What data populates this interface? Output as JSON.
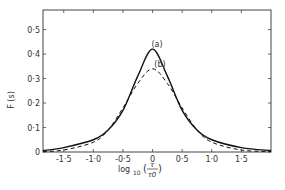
{
  "chart_data": {
    "type": "line",
    "title": "",
    "xlabel": "log10 (τ/τ0)",
    "ylabel": "F (s)",
    "xlim": [
      -1.85,
      2.0
    ],
    "ylim": [
      0,
      0.58
    ],
    "x_ticks": [
      "-1.5",
      "-1.0",
      "-0.5",
      "0",
      "0.5",
      "1.0",
      "1.5"
    ],
    "y_ticks": [
      "0",
      "0.1",
      "0.2",
      "0.3",
      "0.4",
      "0.5"
    ],
    "y_tick_labels": [
      "0",
      "0·1",
      "0·2",
      "0·3",
      "0·4",
      "0·5"
    ],
    "x_tick_labels": [
      "-1·5",
      "-1·0",
      "-0·5",
      "0",
      "0·5",
      "1·0",
      "1·5"
    ],
    "series": [
      {
        "name": "(a)",
        "style": "solid",
        "x": [
          -1.85,
          -1.5,
          -1.0,
          -0.75,
          -0.5,
          -0.25,
          0,
          0.25,
          0.5,
          0.75,
          1.0,
          1.5,
          2.0
        ],
        "y": [
          0.006,
          0.018,
          0.05,
          0.09,
          0.17,
          0.31,
          0.42,
          0.31,
          0.17,
          0.09,
          0.05,
          0.018,
          0.006
        ]
      },
      {
        "name": "(b)",
        "style": "dashed",
        "x": [
          -1.85,
          -1.5,
          -1.0,
          -0.75,
          -0.5,
          -0.25,
          0,
          0.25,
          0.5,
          0.75,
          1.0,
          1.5,
          2.0
        ],
        "y": [
          0.002,
          0.008,
          0.04,
          0.09,
          0.18,
          0.28,
          0.34,
          0.28,
          0.18,
          0.09,
          0.04,
          0.008,
          0.002
        ]
      }
    ],
    "annotations": [
      {
        "text": "(a)",
        "x": 0,
        "y": 0.45
      },
      {
        "text": "(b)",
        "x": 0.05,
        "y": 0.37
      }
    ],
    "grid": false,
    "legend": "none"
  },
  "labels": {
    "ylabel": "F (s)",
    "xlabel_prefix": "log",
    "xlabel_sub": "10",
    "xlabel_num": "τ",
    "xlabel_den": "τ0",
    "annot_a": "(a)",
    "annot_b": "(b)"
  }
}
